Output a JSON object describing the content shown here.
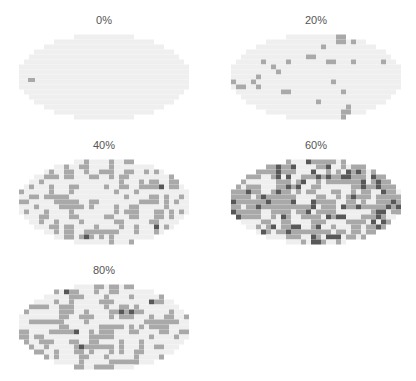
{
  "chart_data": {
    "type": "heatmap",
    "title": "",
    "layout": {
      "rows": 3,
      "cols": 2,
      "panels": 5
    },
    "panels": [
      {
        "label": "0%",
        "fill_fraction": 0.0,
        "dark_fraction": 0.0,
        "seed": 11
      },
      {
        "label": "20%",
        "fill_fraction": 0.2,
        "dark_fraction": 0.0,
        "seed": 23
      },
      {
        "label": "40%",
        "fill_fraction": 0.4,
        "dark_fraction": 0.01,
        "seed": 37
      },
      {
        "label": "60%",
        "fill_fraction": 0.6,
        "dark_fraction": 0.1,
        "seed": 41
      },
      {
        "label": "80%",
        "fill_fraction": 0.4,
        "dark_fraction": 0.02,
        "seed": 53
      }
    ],
    "colors": {
      "empty_cell": "#efefef",
      "filled_cell": "#a9a9a9",
      "dark_cell": "#585858",
      "label": "#555555"
    },
    "grid": {
      "cell_px": 5,
      "ellipse_width_px": 172,
      "ellipse_height_px": 86
    },
    "legend": null,
    "xlabel": "",
    "ylabel": ""
  }
}
